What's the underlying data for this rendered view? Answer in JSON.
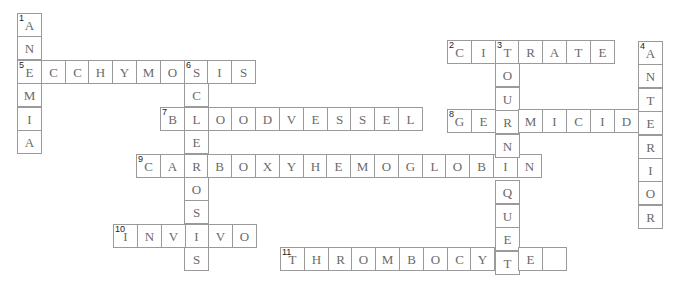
{
  "puzzle": {
    "cell_width": 23.8,
    "cell_height": 23.4,
    "entries": [
      {
        "number": "1",
        "direction": "down",
        "x": 17,
        "y": 13,
        "cells": [
          "A",
          "N",
          "E",
          "M",
          "I",
          "A"
        ]
      },
      {
        "number": "5",
        "direction": "across",
        "x": 17,
        "y": 60,
        "cells": [
          "E",
          "C",
          "C",
          "H",
          "Y",
          "M",
          "O",
          "S",
          "I",
          "S"
        ]
      },
      {
        "number": "6",
        "direction": "down",
        "x": 184,
        "y": 60,
        "cells": [
          "S",
          "C",
          "L",
          "E",
          "R",
          "O",
          "S",
          "I",
          "S"
        ]
      },
      {
        "number": "7",
        "direction": "across",
        "x": 160,
        "y": 107,
        "cells": [
          "B",
          "L",
          "O",
          "O",
          "D",
          "V",
          "E",
          "S",
          "S",
          "E",
          "L"
        ]
      },
      {
        "number": "9",
        "direction": "across",
        "x": 136,
        "y": 154,
        "cells": [
          "C",
          "A",
          "R",
          "B",
          "O",
          "X",
          "Y",
          "H",
          "E",
          "M",
          "O",
          "G",
          "L",
          "O",
          "B",
          "I",
          "N"
        ]
      },
      {
        "number": "10",
        "direction": "across",
        "x": 113,
        "y": 224,
        "cells": [
          "I",
          "N",
          "V",
          "I",
          "V",
          "O"
        ]
      },
      {
        "number": "2",
        "direction": "across",
        "x": 447,
        "y": 40,
        "cells": [
          "C",
          "I",
          "T",
          "R",
          "A",
          "T",
          "E"
        ]
      },
      {
        "number": "3",
        "direction": "down",
        "x": 495,
        "y": 40,
        "cells": [
          "T",
          "O",
          "U",
          "R",
          "N",
          "I",
          "Q",
          "U",
          "E",
          "T"
        ]
      },
      {
        "number": "4",
        "direction": "down",
        "x": 638,
        "y": 41,
        "cells": [
          "A",
          "N",
          "T",
          "E",
          "R",
          "I",
          "O",
          "R"
        ]
      },
      {
        "number": "8",
        "direction": "across",
        "x": 447,
        "y": 109,
        "cells": [
          "G",
          "E",
          "R",
          "M",
          "I",
          "C",
          "I",
          "D",
          "E"
        ]
      },
      {
        "number": "11",
        "direction": "across",
        "x": 280,
        "y": 247,
        "cells": [
          "T",
          "H",
          "R",
          "O",
          "M",
          "B",
          "O",
          "C",
          "Y",
          "T",
          "E",
          ""
        ]
      }
    ]
  }
}
